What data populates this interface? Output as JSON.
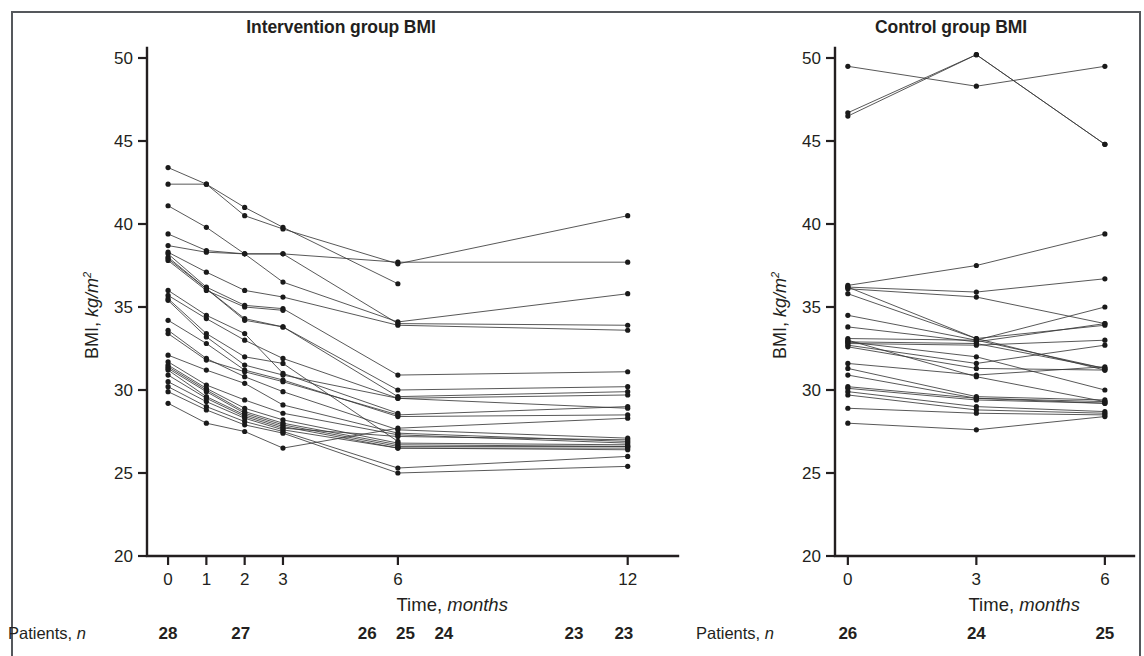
{
  "figure": {
    "background": "#ffffff",
    "ink_color": "#231f20",
    "line_color": "#3a3a3a"
  },
  "panels": [
    {
      "id": "intervention",
      "title": "Intervention group BMI",
      "ylabel_prefix": "BMI, ",
      "ylabel_unit": "kg/m",
      "ylabel_sup": "2",
      "xlabel_prefix": "Time, ",
      "xlabel_unit": "months",
      "n_label_prefix": "Patients, ",
      "n_label_italic": "n",
      "n_counts": [
        "28",
        "27",
        "26",
        "25",
        "24",
        "23",
        "23"
      ]
    },
    {
      "id": "control",
      "title": "Control group BMI",
      "ylabel_prefix": "BMI, ",
      "ylabel_unit": "kg/m",
      "ylabel_sup": "2",
      "xlabel_prefix": "Time, ",
      "xlabel_unit": "months",
      "n_label_prefix": "Patients, ",
      "n_label_italic": "n",
      "n_counts": [
        "26",
        "24",
        "25"
      ]
    }
  ],
  "chart_data": [
    {
      "type": "line",
      "title": "Intervention group BMI",
      "xlabel": "Time, months",
      "ylabel": "BMI, kg/m2",
      "x": [
        0,
        1,
        2,
        3,
        6,
        12
      ],
      "xticks": [
        0,
        1,
        2,
        3,
        6,
        12
      ],
      "yticks": [
        20,
        25,
        30,
        35,
        40,
        45,
        50
      ],
      "xlim": [
        -0.55,
        13.0
      ],
      "ylim": [
        20,
        50
      ],
      "grid": false,
      "legend": "none",
      "markers": "filled-circle",
      "patients_n": {
        "label": "Patients, n",
        "entries": [
          {
            "x": 0,
            "n": 28
          },
          {
            "x": 1.9,
            "n": 27
          },
          {
            "x": 5.2,
            "n": 26
          },
          {
            "x": 6.2,
            "n": 25
          },
          {
            "x": 7.2,
            "n": 24
          },
          {
            "x": 10.6,
            "n": 23
          },
          {
            "x": 11.9,
            "n": 23
          }
        ]
      },
      "series": [
        {
          "name": "p01",
          "x": [
            0,
            1,
            2,
            3,
            6
          ],
          "values": [
            43.4,
            42.4,
            41.0,
            39.8,
            36.4
          ]
        },
        {
          "name": "p02",
          "x": [
            0,
            1,
            2,
            3,
            6,
            12
          ],
          "values": [
            42.4,
            42.4,
            40.5,
            39.7,
            37.6,
            40.5
          ]
        },
        {
          "name": "p03",
          "x": [
            0,
            1,
            2,
            3,
            6,
            12
          ],
          "values": [
            41.1,
            39.8,
            38.2,
            38.2,
            37.7,
            37.7
          ]
        },
        {
          "name": "p04",
          "x": [
            0,
            1,
            2,
            3,
            6,
            12
          ],
          "values": [
            39.4,
            38.4,
            38.2,
            36.5,
            34.1,
            35.8
          ]
        },
        {
          "name": "p05",
          "x": [
            0,
            1,
            2,
            3,
            6,
            12
          ],
          "values": [
            38.7,
            38.3,
            38.2,
            38.2,
            34.0,
            33.9
          ]
        },
        {
          "name": "p06",
          "x": [
            0,
            1,
            2,
            3,
            6,
            12
          ],
          "values": [
            38.3,
            37.1,
            36.0,
            35.6,
            33.9,
            33.6
          ]
        },
        {
          "name": "p07",
          "x": [
            0,
            1,
            2,
            3,
            6,
            12
          ],
          "values": [
            38.2,
            36.2,
            35.1,
            34.9,
            30.9,
            31.1
          ]
        },
        {
          "name": "p08",
          "x": [
            0,
            1,
            2,
            3,
            6,
            12
          ],
          "values": [
            38.0,
            36.1,
            34.3,
            33.8,
            30.0,
            30.2
          ]
        },
        {
          "name": "p09",
          "x": [
            0,
            1,
            2,
            3,
            6,
            12
          ],
          "values": [
            37.9,
            36.1,
            34.2,
            33.8,
            29.6,
            29.9
          ]
        },
        {
          "name": "p10",
          "x": [
            0,
            1,
            2,
            3,
            6,
            12
          ],
          "values": [
            35.7,
            34.3,
            33.0,
            31.9,
            29.5,
            29.7
          ]
        },
        {
          "name": "p11",
          "x": [
            0,
            1,
            2,
            3,
            6,
            12
          ],
          "values": [
            35.4,
            33.2,
            31.5,
            30.9,
            29.5,
            28.9
          ]
        },
        {
          "name": "p12",
          "x": [
            0,
            1,
            2,
            3,
            6,
            12
          ],
          "values": [
            34.2,
            32.8,
            31.2,
            30.6,
            28.4,
            28.5
          ]
        },
        {
          "name": "p13",
          "x": [
            0,
            1,
            2,
            3,
            6,
            12
          ],
          "values": [
            33.6,
            31.9,
            30.8,
            29.9,
            27.6,
            27.1
          ]
        },
        {
          "name": "p14",
          "x": [
            0,
            1,
            2,
            3,
            6,
            12
          ],
          "values": [
            32.1,
            31.2,
            30.4,
            29.1,
            27.4,
            26.9
          ]
        },
        {
          "name": "p15",
          "x": [
            0,
            1,
            2,
            3,
            6,
            12
          ],
          "values": [
            31.7,
            30.3,
            29.4,
            28.6,
            27.3,
            26.8
          ]
        },
        {
          "name": "p16",
          "x": [
            0,
            1,
            2,
            3,
            6,
            12
          ],
          "values": [
            31.5,
            30.1,
            28.9,
            28.2,
            26.8,
            26.7
          ]
        },
        {
          "name": "p17",
          "x": [
            0,
            1,
            2,
            3,
            6,
            12
          ],
          "values": [
            31.4,
            30.0,
            28.7,
            28.0,
            26.7,
            26.6
          ]
        },
        {
          "name": "p18",
          "x": [
            0,
            1,
            2,
            3,
            6,
            12
          ],
          "values": [
            31.3,
            29.9,
            28.6,
            27.9,
            26.6,
            26.6
          ]
        },
        {
          "name": "p19",
          "x": [
            0,
            1,
            2,
            3,
            6,
            12
          ],
          "values": [
            31.2,
            29.6,
            28.5,
            27.8,
            26.5,
            26.5
          ]
        },
        {
          "name": "p20",
          "x": [
            0,
            1,
            2,
            3,
            6,
            12
          ],
          "values": [
            30.9,
            29.5,
            28.4,
            27.7,
            27.2,
            27.0
          ]
        },
        {
          "name": "p21",
          "x": [
            0,
            1,
            2,
            3,
            6,
            12
          ],
          "values": [
            30.5,
            29.3,
            28.3,
            27.6,
            26.5,
            26.4
          ]
        },
        {
          "name": "p22",
          "x": [
            0,
            1,
            2,
            3,
            6,
            12
          ],
          "values": [
            30.2,
            29.0,
            28.1,
            27.5,
            25.3,
            26.0
          ]
        },
        {
          "name": "p23",
          "x": [
            0,
            1,
            2,
            3,
            6,
            12
          ],
          "values": [
            29.9,
            28.8,
            27.9,
            27.4,
            25.0,
            25.4
          ]
        },
        {
          "name": "p24",
          "x": [
            0,
            1,
            2,
            3,
            6,
            12
          ],
          "values": [
            29.2,
            28.0,
            27.5,
            26.5,
            27.7,
            28.3
          ]
        },
        {
          "name": "p25",
          "x": [
            0,
            1,
            2,
            3,
            6
          ],
          "values": [
            36.0,
            34.5,
            33.4,
            31.0,
            28.6
          ]
        },
        {
          "name": "p26",
          "x": [
            0,
            1,
            2,
            3,
            6,
            12
          ],
          "values": [
            33.4,
            31.8,
            31.1,
            30.5,
            28.5,
            29.0
          ]
        },
        {
          "name": "p27",
          "x": [
            0,
            1,
            2,
            3
          ],
          "values": [
            37.8,
            36.0,
            35.0,
            34.8
          ]
        },
        {
          "name": "p28",
          "x": [
            0,
            1,
            2,
            3,
            6
          ],
          "values": [
            35.5,
            33.4,
            32.0,
            31.6,
            26.9
          ]
        }
      ]
    },
    {
      "type": "line",
      "title": "Control group BMI",
      "xlabel": "Time, months",
      "ylabel": "BMI, kg/m2",
      "x": [
        0,
        3,
        6
      ],
      "xticks": [
        0,
        3,
        6
      ],
      "yticks": [
        20,
        25,
        30,
        35,
        40,
        45,
        50
      ],
      "xlim": [
        -0.3,
        6.4
      ],
      "ylim": [
        20,
        50
      ],
      "grid": false,
      "legend": "none",
      "markers": "filled-circle",
      "patients_n": {
        "label": "Patients, n",
        "entries": [
          {
            "x": 0,
            "n": 26
          },
          {
            "x": 3,
            "n": 24
          },
          {
            "x": 6,
            "n": 25
          }
        ]
      },
      "series": [
        {
          "name": "c01",
          "x": [
            0,
            3,
            6
          ],
          "values": [
            49.5,
            48.3,
            49.5
          ]
        },
        {
          "name": "c02",
          "x": [
            0,
            3,
            6
          ],
          "values": [
            46.7,
            50.2,
            44.8
          ]
        },
        {
          "name": "c03",
          "x": [
            0,
            3,
            6
          ],
          "values": [
            46.5,
            50.2,
            44.8
          ]
        },
        {
          "name": "c04",
          "x": [
            0,
            3,
            6
          ],
          "values": [
            36.3,
            37.5,
            39.4
          ]
        },
        {
          "name": "c05",
          "x": [
            0,
            3,
            6
          ],
          "values": [
            36.2,
            35.9,
            36.7
          ]
        },
        {
          "name": "c06",
          "x": [
            0,
            3,
            6
          ],
          "values": [
            36.1,
            35.6,
            34.0
          ]
        },
        {
          "name": "c07",
          "x": [
            0,
            3,
            6
          ],
          "values": [
            35.8,
            33.1,
            33.9
          ]
        },
        {
          "name": "c08",
          "x": [
            0,
            3,
            6
          ],
          "values": [
            34.5,
            33.0,
            35.0
          ]
        },
        {
          "name": "c09",
          "x": [
            0,
            3,
            6
          ],
          "values": [
            33.8,
            32.9,
            34.0
          ]
        },
        {
          "name": "c10",
          "x": [
            0,
            3,
            6
          ],
          "values": [
            33.1,
            33.0,
            31.3
          ]
        },
        {
          "name": "c11",
          "x": [
            0,
            3,
            6
          ],
          "values": [
            32.9,
            32.8,
            31.3
          ]
        },
        {
          "name": "c12",
          "x": [
            0,
            3,
            6
          ],
          "values": [
            32.8,
            32.7,
            33.0
          ]
        },
        {
          "name": "c13",
          "x": [
            0,
            3,
            6
          ],
          "values": [
            32.7,
            31.6,
            32.7
          ]
        },
        {
          "name": "c14",
          "x": [
            0,
            3,
            6
          ],
          "values": [
            32.6,
            31.3,
            31.2
          ]
        },
        {
          "name": "c15",
          "x": [
            0,
            3,
            6
          ],
          "values": [
            31.6,
            30.9,
            31.4
          ]
        },
        {
          "name": "c16",
          "x": [
            0,
            3,
            6
          ],
          "values": [
            31.3,
            29.6,
            29.4
          ]
        },
        {
          "name": "c17",
          "x": [
            0,
            3,
            6
          ],
          "values": [
            30.9,
            29.5,
            29.3
          ]
        },
        {
          "name": "c18",
          "x": [
            0,
            3,
            6
          ],
          "values": [
            30.2,
            29.5,
            29.2
          ]
        },
        {
          "name": "c19",
          "x": [
            0,
            3,
            6
          ],
          "values": [
            30.1,
            29.4,
            29.2
          ]
        },
        {
          "name": "c20",
          "x": [
            0,
            3,
            6
          ],
          "values": [
            29.9,
            29.0,
            28.7
          ]
        },
        {
          "name": "c21",
          "x": [
            0,
            3,
            6
          ],
          "values": [
            29.7,
            28.8,
            28.6
          ]
        },
        {
          "name": "c22",
          "x": [
            0,
            3,
            6
          ],
          "values": [
            28.9,
            28.6,
            28.5
          ]
        },
        {
          "name": "c23",
          "x": [
            0,
            3,
            6
          ],
          "values": [
            28.0,
            27.6,
            28.4
          ]
        },
        {
          "name": "c24",
          "x": [
            0,
            3,
            6
          ],
          "values": [
            33.0,
            30.8,
            29.3
          ]
        },
        {
          "name": "c25",
          "x": [
            0,
            3,
            6
          ],
          "values": [
            32.9,
            32.0,
            30.0
          ]
        },
        {
          "name": "c26",
          "x": [
            0,
            3,
            6
          ],
          "values": [
            36.2,
            33.1,
            31.2
          ]
        }
      ]
    }
  ]
}
